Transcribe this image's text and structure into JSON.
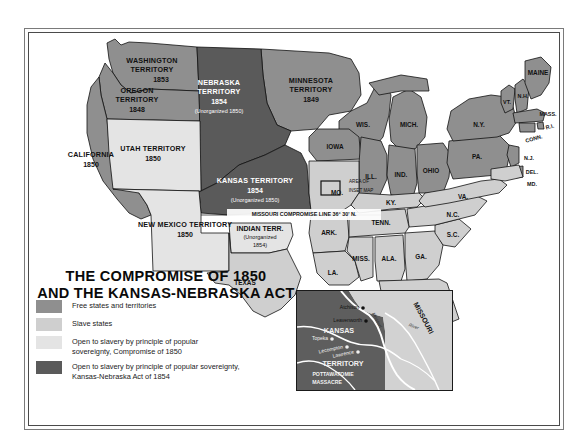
{
  "map": {
    "title_line1": "THE COMPROMISE OF 1850",
    "title_line2": "AND THE KANSAS-NEBRASKA ACT",
    "colors": {
      "free": "#8f8f8f",
      "slave": "#cfcfcf",
      "popular_sovereignty_1850": "#e4e4e4",
      "kansas_nebraska_1854": "#5a5a5a",
      "water": "#ffffff",
      "ink": "#111111"
    },
    "legend": [
      {
        "swatch": "#8f8f8f",
        "label": "Free states and territories"
      },
      {
        "swatch": "#cfcfcf",
        "label": "Slave states"
      },
      {
        "swatch": "#e4e4e4",
        "label": "Open to slavery by principle of popular\nsovereignty, Compromise of 1850"
      },
      {
        "swatch": "#5a5a5a",
        "label": "Open to slavery by principle of popular sovereignty,\nKansas-Nebraska Act of 1854"
      }
    ],
    "territories": [
      {
        "name": "WASHINGTON\nTERRITORY",
        "year": "1853",
        "fill": "free"
      },
      {
        "name": "OREGON\nTERRITORY",
        "year": "1848",
        "fill": "free"
      },
      {
        "name": "UTAH TERRITORY",
        "year": "1850",
        "fill": "popular_sovereignty_1850"
      },
      {
        "name": "NEW MEXICO TERRITORY",
        "year": "1850",
        "fill": "popular_sovereignty_1850"
      },
      {
        "name": "NEBRASKA\nTERRITORY",
        "year": "1854",
        "note": "(Unorganized 1850)",
        "fill": "kansas_nebraska_1854"
      },
      {
        "name": "KANSAS TERRITORY",
        "year": "1854",
        "note": "(Unorganized 1850)",
        "fill": "kansas_nebraska_1854"
      },
      {
        "name": "MINNESOTA\nTERRITORY",
        "year": "1849",
        "fill": "free"
      },
      {
        "name": "INDIAN TERR.",
        "note": "(Unorganized\n1854)",
        "fill": "popular_sovereignty_1850"
      }
    ],
    "annotations": {
      "missouri_compromise_line": "MISSOURI COMPROMISE LINE 36° 30' N.",
      "inset_callout_line1": "AREA OF",
      "inset_callout_line2": "INSET MAP"
    },
    "state_labels": {
      "california": "CALIFORNIA",
      "california_year": "1850",
      "texas": "TEXAS",
      "iowa": "IOWA",
      "wisconsin": "WIS.",
      "michigan": "MICH.",
      "illinois": "ILL.",
      "indiana": "IND.",
      "ohio": "OHIO",
      "missouri": "MO.",
      "arkansas": "ARK.",
      "louisiana": "LA.",
      "mississippi": "MISS.",
      "alabama": "ALA.",
      "georgia": "GA.",
      "florida": "FLA.",
      "south_carolina": "S.C.",
      "north_carolina": "N.C.",
      "tennessee": "TENN.",
      "kentucky": "KY.",
      "virginia": "VA.",
      "maryland": "MD.",
      "delaware": "DEL.",
      "new_jersey": "N.J.",
      "pennsylvania": "PA.",
      "new_york": "N.Y.",
      "connecticut": "CONN.",
      "rhode_island": "R.I.",
      "massachusetts": "MASS.",
      "vermont": "VT.",
      "new_hampshire": "N.H.",
      "maine": "MAINE"
    }
  },
  "inset": {
    "kansas_label_line1": "KANSAS",
    "kansas_label_line2": "TERRITORY",
    "missouri_label": "MISSOURI",
    "river_label": "Missouri",
    "river_label2": "River",
    "cities": [
      {
        "name": "Atchison"
      },
      {
        "name": "Leavenworth"
      },
      {
        "name": "Topeka"
      },
      {
        "name": "Lecompton"
      },
      {
        "name": "Lawrence"
      }
    ],
    "event_marker": "×",
    "event_line1": "POTTAWATOMIE",
    "event_line2": "MASSACRE"
  }
}
